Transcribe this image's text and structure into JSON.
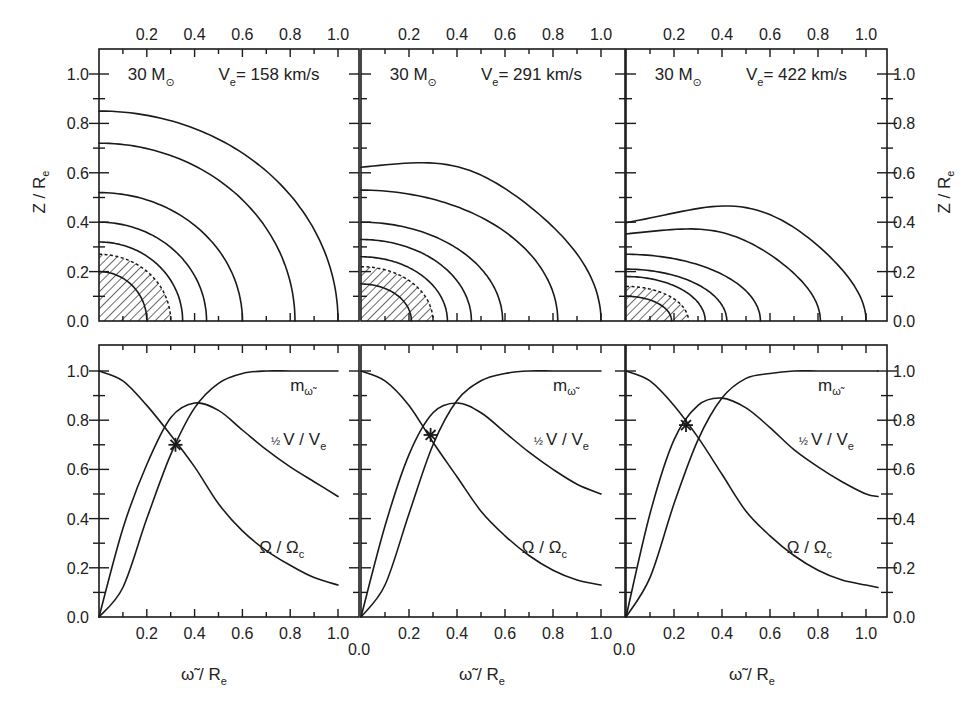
{
  "figure": {
    "top_row_ylabel": "Z / R",
    "top_row_ylabel_sub": "e",
    "bottom_row_xlabel": "ω̃ / R",
    "bottom_row_xlabel_sub": "e",
    "panels": [
      {
        "mass": "30 M",
        "mass_sub": "⊙",
        "ve_label": "V",
        "ve_sub": "e",
        "ve_value": "= 158 km/s"
      },
      {
        "mass": "30 M",
        "mass_sub": "⊙",
        "ve_label": "V",
        "ve_sub": "e",
        "ve_value": "= 291 km/s"
      },
      {
        "mass": "30 M",
        "mass_sub": "⊙",
        "ve_label": "V",
        "ve_sub": "e",
        "ve_value": "= 422 km/s"
      }
    ],
    "curve_labels": {
      "m": "m",
      "m_sub": "ω̃",
      "v_half": "½",
      "v": "V / V",
      "v_sub": "e",
      "omega": "Ω / Ω",
      "omega_sub": "c"
    },
    "top_x_tick_labels": [
      "0.2",
      "0.4",
      "0.6",
      "0.8",
      "1.0"
    ],
    "bottom_x_tick_labels": [
      "0.2",
      "0.4",
      "0.6",
      "0.8",
      "1.0"
    ],
    "origin_label": "0.0",
    "y_tick_labels": [
      "0.0",
      "0.2",
      "0.4",
      "0.6",
      "0.8",
      "1.0"
    ]
  },
  "chart_data": [
    {
      "type": "line",
      "title": "30 M☉, Ve = 158 km/s — meridional contours",
      "xlabel": "ω̃ / Re",
      "ylabel": "Z / Re",
      "xlim": [
        0,
        1.08
      ],
      "ylim": [
        0,
        1.1
      ],
      "contours": [
        {
          "polar_radius": 0.85,
          "equatorial_radius": 1.0
        },
        {
          "polar_radius": 0.72,
          "equatorial_radius": 0.82
        },
        {
          "polar_radius": 0.52,
          "equatorial_radius": 0.6
        },
        {
          "polar_radius": 0.4,
          "equatorial_radius": 0.45
        },
        {
          "polar_radius": 0.32,
          "equatorial_radius": 0.35
        },
        {
          "polar_radius": 0.27,
          "equatorial_radius": 0.3,
          "style": "dashed"
        },
        {
          "polar_radius": 0.2,
          "equatorial_radius": 0.2,
          "style": "hatched-core"
        }
      ],
      "hatched_region_radius": 0.3
    },
    {
      "type": "line",
      "title": "30 M☉, Ve = 291 km/s — meridional contours",
      "xlabel": "ω̃ / Re",
      "ylabel": "Z / Re",
      "xlim": [
        0,
        1.08
      ],
      "ylim": [
        0,
        1.1
      ],
      "contours": [
        {
          "polar_radius": 0.61,
          "max_height": 0.68,
          "max_at_x": 0.45,
          "equatorial_radius": 1.0
        },
        {
          "polar_radius": 0.53,
          "equatorial_radius": 0.82
        },
        {
          "polar_radius": 0.4,
          "equatorial_radius": 0.59
        },
        {
          "polar_radius": 0.33,
          "equatorial_radius": 0.46
        },
        {
          "polar_radius": 0.26,
          "equatorial_radius": 0.36
        },
        {
          "polar_radius": 0.22,
          "equatorial_radius": 0.3,
          "style": "dashed"
        },
        {
          "polar_radius": 0.15,
          "equatorial_radius": 0.21,
          "style": "hatched-core"
        }
      ],
      "hatched_region_radius": 0.3
    },
    {
      "type": "line",
      "title": "30 M☉, Ve = 422 km/s — meridional contours",
      "xlabel": "ω̃ / Re",
      "ylabel": "Z / Re",
      "xlim": [
        0,
        1.08
      ],
      "ylim": [
        0,
        1.1
      ],
      "contours": [
        {
          "polar_radius": 0.37,
          "max_height": 0.53,
          "max_at_x": 0.6,
          "equatorial_radius": 1.0
        },
        {
          "polar_radius": 0.34,
          "max_height": 0.41,
          "max_at_x": 0.45,
          "equatorial_radius": 0.81
        },
        {
          "polar_radius": 0.27,
          "equatorial_radius": 0.56
        },
        {
          "polar_radius": 0.21,
          "equatorial_radius": 0.42
        },
        {
          "polar_radius": 0.18,
          "equatorial_radius": 0.33
        },
        {
          "polar_radius": 0.14,
          "equatorial_radius": 0.26,
          "style": "dashed"
        },
        {
          "polar_radius": 0.1,
          "equatorial_radius": 0.19,
          "style": "hatched-core"
        }
      ],
      "hatched_region_radius": 0.26
    },
    {
      "type": "line",
      "title": "Ve = 158 km/s — rotation profiles",
      "xlabel": "ω̃ / Re",
      "ylabel": "",
      "xlim": [
        0,
        1.08
      ],
      "ylim": [
        0,
        1.1
      ],
      "x": [
        0.0,
        0.1,
        0.2,
        0.3,
        0.4,
        0.5,
        0.6,
        0.7,
        0.8,
        0.9,
        1.0
      ],
      "series": [
        {
          "name": "m_ω̃",
          "values": [
            0.0,
            0.12,
            0.4,
            0.66,
            0.85,
            0.95,
            0.99,
            1.0,
            1.0,
            1.0,
            1.0
          ]
        },
        {
          "name": "½ V/Ve",
          "values": [
            0.0,
            0.36,
            0.62,
            0.81,
            0.87,
            0.84,
            0.76,
            0.68,
            0.61,
            0.55,
            0.49
          ]
        },
        {
          "name": "Ω/Ωc",
          "values": [
            1.0,
            0.96,
            0.86,
            0.74,
            0.61,
            0.46,
            0.35,
            0.27,
            0.21,
            0.16,
            0.13
          ]
        }
      ],
      "marker": {
        "x": 0.32,
        "y": 0.7,
        "symbol": "star"
      }
    },
    {
      "type": "line",
      "title": "Ve = 291 km/s — rotation profiles",
      "xlabel": "ω̃ / Re",
      "ylabel": "",
      "xlim": [
        0,
        1.08
      ],
      "ylim": [
        0,
        1.1
      ],
      "x": [
        0.0,
        0.1,
        0.2,
        0.3,
        0.4,
        0.5,
        0.6,
        0.7,
        0.8,
        0.9,
        1.0
      ],
      "series": [
        {
          "name": "m_ω̃",
          "values": [
            0.0,
            0.13,
            0.42,
            0.7,
            0.88,
            0.96,
            0.99,
            1.0,
            1.0,
            1.0,
            1.0
          ]
        },
        {
          "name": "½ V/Ve",
          "values": [
            0.0,
            0.37,
            0.66,
            0.83,
            0.87,
            0.83,
            0.75,
            0.67,
            0.6,
            0.54,
            0.5
          ]
        },
        {
          "name": "Ω/Ωc",
          "values": [
            1.0,
            0.96,
            0.86,
            0.71,
            0.57,
            0.43,
            0.33,
            0.25,
            0.19,
            0.15,
            0.13
          ]
        }
      ],
      "marker": {
        "x": 0.29,
        "y": 0.74,
        "symbol": "star"
      }
    },
    {
      "type": "line",
      "title": "Ve = 422 km/s — rotation profiles",
      "xlabel": "ω̃ / Re",
      "ylabel": "",
      "xlim": [
        0,
        1.08
      ],
      "ylim": [
        0,
        1.1
      ],
      "x": [
        0.0,
        0.1,
        0.2,
        0.3,
        0.4,
        0.5,
        0.6,
        0.7,
        0.8,
        0.9,
        1.0,
        1.05
      ],
      "series": [
        {
          "name": "m_ω̃",
          "values": [
            0.0,
            0.16,
            0.46,
            0.72,
            0.89,
            0.97,
            0.99,
            1.0,
            1.0,
            1.0,
            1.0,
            1.0
          ]
        },
        {
          "name": "½ V/Ve",
          "values": [
            0.0,
            0.42,
            0.72,
            0.86,
            0.89,
            0.85,
            0.77,
            0.68,
            0.61,
            0.55,
            0.5,
            0.49
          ]
        },
        {
          "name": "Ω/Ωc",
          "values": [
            1.0,
            0.96,
            0.86,
            0.73,
            0.58,
            0.43,
            0.33,
            0.25,
            0.19,
            0.15,
            0.13,
            0.12
          ]
        }
      ],
      "marker": {
        "x": 0.25,
        "y": 0.78,
        "symbol": "star"
      }
    }
  ]
}
